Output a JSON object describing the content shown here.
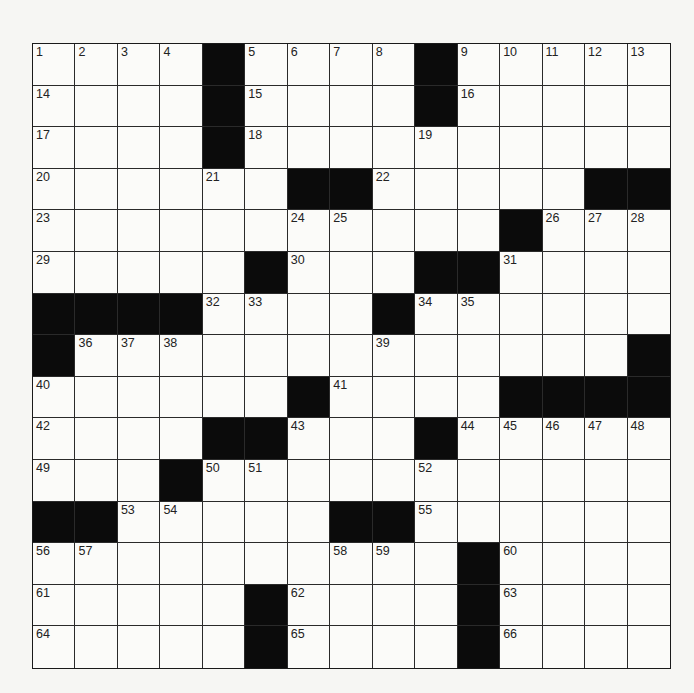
{
  "puzzle": {
    "rows": 15,
    "cols": 15,
    "colors": {
      "block": "#0b0b0b",
      "cell": "#fbfbf9",
      "line": "#2a2a2a",
      "paper": "#f6f6f3"
    },
    "grid": [
      [
        "1",
        "2",
        "3",
        "4",
        "#",
        "5",
        "6",
        "7",
        "8",
        "#",
        "9",
        "10",
        "11",
        "12",
        "13"
      ],
      [
        "14",
        "",
        "",
        "",
        "#",
        "15",
        "",
        "",
        "",
        "#",
        "16",
        "",
        "",
        "",
        ""
      ],
      [
        "17",
        "",
        "",
        "",
        "#",
        "18",
        "",
        "",
        "",
        "19",
        "",
        "",
        "",
        "",
        ""
      ],
      [
        "20",
        "",
        "",
        "",
        "21",
        "",
        "#",
        "#",
        "22",
        "",
        "",
        "",
        "",
        "#",
        "#"
      ],
      [
        "23",
        "",
        "",
        "",
        "",
        "",
        "24",
        "25",
        "",
        "",
        "",
        "#",
        "26",
        "27",
        "28"
      ],
      [
        "29",
        "",
        "",
        "",
        "",
        "#",
        "30",
        "",
        "",
        "#",
        "#",
        "31",
        "",
        "",
        ""
      ],
      [
        "#",
        "#",
        "#",
        "#",
        "32",
        "33",
        "",
        "",
        "#",
        "34",
        "35",
        "",
        "",
        "",
        ""
      ],
      [
        "#",
        "36",
        "37",
        "38",
        "",
        "",
        "",
        "",
        "39",
        "",
        "",
        "",
        "",
        "",
        "#"
      ],
      [
        "40",
        "",
        "",
        "",
        "",
        "",
        "#",
        "41",
        "",
        "",
        "",
        "#",
        "#",
        "#",
        "#"
      ],
      [
        "42",
        "",
        "",
        "",
        "#",
        "#",
        "43",
        "",
        "",
        "#",
        "44",
        "45",
        "46",
        "47",
        "48"
      ],
      [
        "49",
        "",
        "",
        "#",
        "50",
        "51",
        "",
        "",
        "",
        "52",
        "",
        "",
        "",
        "",
        ""
      ],
      [
        "#",
        "#",
        "53",
        "54",
        "",
        "",
        "",
        "#",
        "#",
        "55",
        "",
        "",
        "",
        "",
        ""
      ],
      [
        "56",
        "57",
        "",
        "",
        "",
        "",
        "",
        "58",
        "59",
        "",
        "#",
        "60",
        "",
        "",
        ""
      ],
      [
        "61",
        "",
        "",
        "",
        "",
        "#",
        "62",
        "",
        "",
        "",
        "#",
        "63",
        "",
        "",
        ""
      ],
      [
        "64",
        "",
        "",
        "",
        "",
        "#",
        "65",
        "",
        "",
        "",
        "#",
        "66",
        "",
        "",
        ""
      ]
    ]
  }
}
